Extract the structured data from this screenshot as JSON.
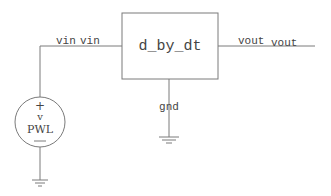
{
  "schematic": {
    "block": {
      "label": "d_by_dt"
    },
    "input_net": {
      "pin_label": "vin",
      "net_label": "vin"
    },
    "output_net": {
      "pin_label": "vout",
      "net_label": "vout"
    },
    "ground_net": {
      "label": "gnd"
    },
    "source": {
      "plus": "+",
      "type_label": "v",
      "name": "PWL",
      "minus": "—"
    }
  },
  "colors": {
    "wire": "#7a7a7a",
    "text": "#444444",
    "background": "#ffffff"
  }
}
